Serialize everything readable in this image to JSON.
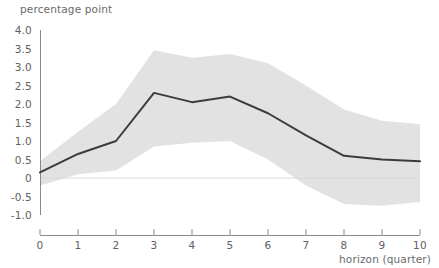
{
  "chart_data": {
    "type": "line",
    "title": "",
    "ylabel": "percentage point",
    "xlabel": "horizon (quarter)",
    "x": [
      0,
      1,
      2,
      3,
      4,
      5,
      6,
      7,
      8,
      9,
      10
    ],
    "xlim": [
      0,
      10
    ],
    "ylim": [
      -1.0,
      4.0
    ],
    "grid": false,
    "legend": "none",
    "zero_line": 0,
    "xticks": [
      "0",
      "1",
      "2",
      "3",
      "4",
      "5",
      "6",
      "7",
      "8",
      "9",
      "10"
    ],
    "yticks": [
      "4.0",
      "3.5",
      "3.0",
      "2.5",
      "2.0",
      "1.5",
      "1.0",
      "0.5",
      "0",
      "-0.5",
      "-1.0"
    ],
    "ytick_values": [
      4.0,
      3.5,
      3.0,
      2.5,
      2.0,
      1.5,
      1.0,
      0.5,
      0,
      -0.5,
      -1.0
    ],
    "series": [
      {
        "name": "impulse response",
        "type": "line",
        "color": "#3c3c3c",
        "values": [
          0.15,
          0.65,
          1.0,
          2.3,
          2.05,
          2.2,
          1.75,
          1.15,
          0.6,
          0.5,
          0.45
        ]
      }
    ],
    "band": {
      "name": "confidence band",
      "color": "#e2e2e2",
      "upper": [
        0.45,
        1.25,
        2.0,
        3.45,
        3.25,
        3.35,
        3.1,
        2.5,
        1.85,
        1.55,
        1.45
      ],
      "lower": [
        -0.2,
        0.1,
        0.2,
        0.85,
        0.95,
        1.0,
        0.5,
        -0.2,
        -0.7,
        -0.75,
        -0.65
      ]
    },
    "colors": {
      "line": "#3c3c3c",
      "band": "#e2e2e2",
      "axis": "#8a8a8a",
      "zero_line": "#d8d8d8",
      "text": "#5f5f5f",
      "background": "#ffffff"
    }
  }
}
